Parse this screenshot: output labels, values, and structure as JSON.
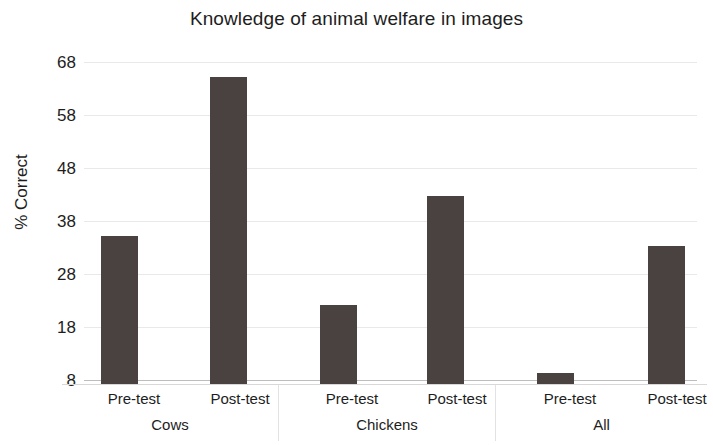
{
  "chart_data": {
    "type": "bar",
    "title": "Knowledge of animal welfare in images",
    "xlabel": "",
    "ylabel": "% Correct",
    "ylim": [
      8,
      68
    ],
    "yticks": [
      8,
      18,
      28,
      38,
      48,
      58,
      68
    ],
    "grid": true,
    "legend": null,
    "groups": [
      "Cows",
      "Chickens",
      "All"
    ],
    "categories": [
      "Pre-test",
      "Post-test",
      "Pre-test",
      "Post-test",
      "Pre-test",
      "Post-test"
    ],
    "values": [
      36,
      66,
      23,
      43.5,
      10,
      34
    ],
    "series": [
      {
        "name": "% Correct",
        "points": [
          {
            "group": "Cows",
            "category": "Pre-test",
            "value": 36
          },
          {
            "group": "Cows",
            "category": "Post-test",
            "value": 66
          },
          {
            "group": "Chickens",
            "category": "Pre-test",
            "value": 23
          },
          {
            "group": "Chickens",
            "category": "Post-test",
            "value": 43.5
          },
          {
            "group": "All",
            "category": "Pre-test",
            "value": 10
          },
          {
            "group": "All",
            "category": "Post-test",
            "value": 34
          }
        ]
      }
    ],
    "bar_color": "#4a4240",
    "background_color": "#ffffff",
    "gridline_color": "#e9e9ea"
  },
  "axis": {
    "y_label": "% Correct",
    "y_tick_labels": [
      "68",
      "58",
      "48",
      "38",
      "28",
      "18",
      "8"
    ],
    "x_tick_labels": [
      "Pre-test",
      "Post-test",
      "Pre-test",
      "Post-test",
      "Pre-test",
      "Post-test"
    ],
    "x_group_labels": [
      "Cows",
      "Chickens",
      "All"
    ]
  },
  "title": "Knowledge of animal welfare in images"
}
